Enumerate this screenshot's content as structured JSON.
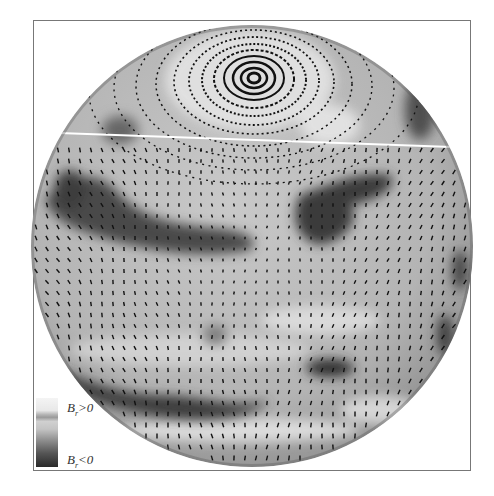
{
  "figure": {
    "legend": {
      "positive_symbol": "B",
      "positive_sub": "r",
      "positive_rel": ">0",
      "negative_symbol": "B",
      "negative_sub": "r",
      "negative_rel": "<0"
    },
    "colors": {
      "positive": "#f2f2f2",
      "negative": "#2a2a2a",
      "background": "#ffffff",
      "frame": "#777777"
    }
  }
}
